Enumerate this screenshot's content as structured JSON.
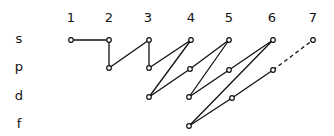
{
  "shell_labels": [
    "1",
    "2",
    "3",
    "4",
    "5",
    "6",
    "7"
  ],
  "subshell_labels": [
    "s",
    "p",
    "d",
    "f"
  ],
  "colors": {
    "line": "#111111",
    "node_fill": "#ffffff",
    "background": "#ffffff"
  },
  "nodes": [
    {
      "id": "1s",
      "x": 71,
      "y": 40
    },
    {
      "id": "2s",
      "x": 109,
      "y": 40
    },
    {
      "id": "2p",
      "x": 109,
      "y": 68
    },
    {
      "id": "3s",
      "x": 149,
      "y": 40
    },
    {
      "id": "3p",
      "x": 149,
      "y": 68
    },
    {
      "id": "3d",
      "x": 149,
      "y": 97
    },
    {
      "id": "4s",
      "x": 191,
      "y": 40
    },
    {
      "id": "4p",
      "x": 190,
      "y": 69
    },
    {
      "id": "4d",
      "x": 189,
      "y": 97
    },
    {
      "id": "4f",
      "x": 189,
      "y": 126
    },
    {
      "id": "5s",
      "x": 229,
      "y": 40
    },
    {
      "id": "5p",
      "x": 229,
      "y": 70
    },
    {
      "id": "5d",
      "x": 232,
      "y": 98
    },
    {
      "id": "6s",
      "x": 273,
      "y": 40
    },
    {
      "id": "6p",
      "x": 273,
      "y": 70
    },
    {
      "id": "7s",
      "x": 313,
      "y": 40
    }
  ],
  "edges": [
    {
      "from": "1s",
      "to": "2s",
      "style": "solid"
    },
    {
      "from": "2s",
      "to": "2p",
      "style": "solid"
    },
    {
      "from": "2p",
      "to": "3s",
      "style": "solid"
    },
    {
      "from": "3s",
      "to": "3p",
      "style": "solid"
    },
    {
      "from": "3p",
      "to": "4s",
      "style": "solid"
    },
    {
      "from": "4s",
      "to": "3d",
      "style": "solid"
    },
    {
      "from": "3d",
      "to": "4p",
      "style": "solid"
    },
    {
      "from": "4p",
      "to": "5s",
      "style": "solid"
    },
    {
      "from": "5s",
      "to": "4d",
      "style": "solid"
    },
    {
      "from": "4d",
      "to": "5p",
      "style": "solid"
    },
    {
      "from": "5p",
      "to": "6s",
      "style": "solid"
    },
    {
      "from": "6s",
      "to": "4f",
      "style": "solid"
    },
    {
      "from": "4f",
      "to": "5d",
      "style": "solid"
    },
    {
      "from": "5d",
      "to": "6p",
      "style": "solid"
    },
    {
      "from": "6p",
      "to": "7s",
      "style": "dashed"
    }
  ]
}
